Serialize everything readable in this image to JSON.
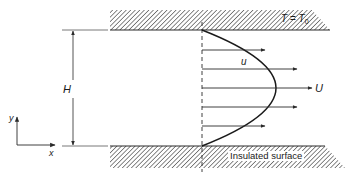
{
  "diagram": {
    "type": "channel-flow-velocity-profile",
    "colors": {
      "line": "#2a2a2a",
      "hatch": "#555555",
      "background": "#ffffff"
    },
    "top_wall": {
      "label_T": "T",
      "label_eq": " = ",
      "label_T0_base": "T",
      "label_T0_sub": "0"
    },
    "bottom_wall": {
      "label": "Insulated surface"
    },
    "dimension": {
      "label": "H"
    },
    "velocity": {
      "local_label": "u",
      "max_label": "U",
      "arrow_count": 5
    },
    "axes": {
      "x_label": "x",
      "y_label": "y"
    }
  }
}
